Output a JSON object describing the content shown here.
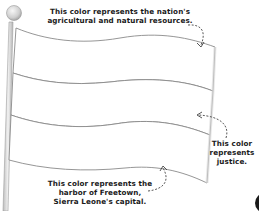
{
  "annotations": {
    "top": {
      "lines": [
        "This color represents the nation's",
        "agricultural and natural resources."
      ]
    },
    "right": {
      "lines": [
        "This color",
        "represents",
        "justice."
      ]
    },
    "bottom": {
      "lines": [
        "This color represents the",
        "harbor of Freetown,",
        "Sierra Leone's capital."
      ]
    }
  },
  "flag": {
    "stripes": 3,
    "stripe_fill": "#ffffff",
    "outline_color": "#8a8a8a"
  },
  "colors": {
    "text": "#1a1a1a",
    "pole": "#d9d9d9",
    "finial": "#cfcfcf",
    "arrow": "#444444"
  }
}
